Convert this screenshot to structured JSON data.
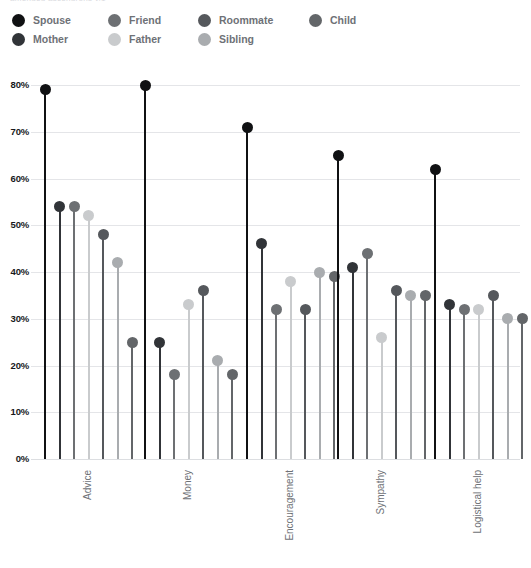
{
  "caption": "amended ascendrons v.1",
  "legend": {
    "position": "top-left",
    "items": [
      {
        "label": "Spouse",
        "color": "#101113"
      },
      {
        "label": "Mother",
        "color": "#313438"
      },
      {
        "label": "Friend",
        "color": "#6d7073"
      },
      {
        "label": "Father",
        "color": "#c9cbcd"
      },
      {
        "label": "Roommate",
        "color": "#55585c"
      },
      {
        "label": "Sibling",
        "color": "#a9acaf"
      },
      {
        "label": "Child",
        "color": "#636669"
      }
    ]
  },
  "chart_data": {
    "type": "bar",
    "subtype": "grouped-lollipop",
    "title": "",
    "xlabel": "",
    "ylabel": "",
    "ylim": [
      0,
      80
    ],
    "yticks": [
      "0%",
      "10%",
      "20%",
      "30%",
      "40%",
      "50%",
      "60%",
      "70%",
      "80%"
    ],
    "ytick_values": [
      0,
      10,
      20,
      30,
      40,
      50,
      60,
      70,
      80
    ],
    "grid": true,
    "categories": [
      "Advice",
      "Money",
      "Encouragement",
      "Sympathy",
      "Logistical help"
    ],
    "series": [
      {
        "name": "Spouse",
        "color": "#101113",
        "values": [
          79,
          80,
          71,
          65,
          62
        ]
      },
      {
        "name": "Mother",
        "color": "#313438",
        "values": [
          54,
          25,
          46,
          41,
          33
        ]
      },
      {
        "name": "Friend",
        "color": "#6d7073",
        "values": [
          54,
          18,
          32,
          44,
          32
        ]
      },
      {
        "name": "Father",
        "color": "#c9cbcd",
        "values": [
          52,
          33,
          38,
          26,
          32
        ]
      },
      {
        "name": "Roommate",
        "color": "#55585c",
        "values": [
          48,
          36,
          32,
          36,
          35
        ]
      },
      {
        "name": "Sibling",
        "color": "#a9acaf",
        "values": [
          42,
          21,
          40,
          35,
          30
        ]
      },
      {
        "name": "Child",
        "color": "#636669",
        "values": [
          25,
          18,
          39,
          35,
          30
        ]
      }
    ]
  }
}
